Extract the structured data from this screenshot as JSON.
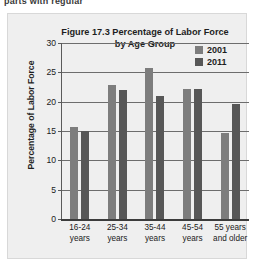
{
  "page": {
    "top_cut_text": "parts with regular"
  },
  "chart_data": {
    "type": "bar",
    "title": "Figure 17.3 Percentage of Labor Force by Age Group",
    "title_line1": "Figure 17.3 Percentage of Labor Force",
    "title_line2": "by Age Group",
    "xlabel": "",
    "ylabel": "Percentage of Labor Force",
    "ylim": [
      0,
      30
    ],
    "yticks": [
      30,
      25,
      20,
      15,
      10,
      5,
      0
    ],
    "grid": true,
    "legend_position": "top-right",
    "categories": [
      "16-24 years",
      "25-34 years",
      "35-44 years",
      "45-54 years",
      "55 years and older"
    ],
    "category_lines": [
      [
        "16-24",
        "years"
      ],
      [
        "25-34",
        "years"
      ],
      [
        "35-44",
        "years"
      ],
      [
        "45-54",
        "years"
      ],
      [
        "55 years",
        "and older"
      ]
    ],
    "series": [
      {
        "name": "2001",
        "color": "#7d7d7d",
        "values": [
          15.7,
          22.8,
          25.7,
          22.1,
          14.6
        ]
      },
      {
        "name": "2011",
        "color": "#575757",
        "values": [
          15.0,
          22.0,
          21.0,
          22.2,
          19.6
        ]
      }
    ]
  }
}
